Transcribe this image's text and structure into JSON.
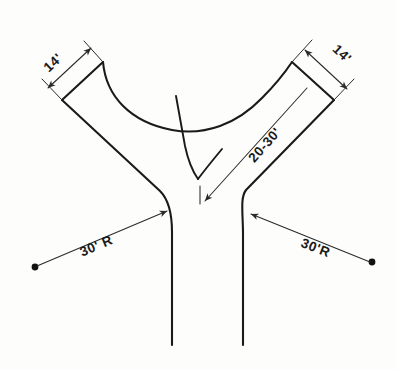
{
  "drawing": {
    "title": "Y-Intersection / Driveway Throat Detail",
    "background_color": "#fdfdfc",
    "line_color": "#1a1a1a",
    "annotation_color": "#2a2a2a"
  },
  "annotations": {
    "left_width": {
      "label": "14'",
      "value": 14,
      "unit": "ft",
      "kind": "linear-dimension",
      "position": "top-left"
    },
    "right_width": {
      "label": "14'",
      "value": 14,
      "unit": "ft",
      "kind": "linear-dimension",
      "position": "top-right"
    },
    "throat_length": {
      "label": "20-30'",
      "value_min": 20,
      "value_max": 30,
      "unit": "ft",
      "kind": "leader-dimension",
      "position": "center-right"
    },
    "left_radius": {
      "label": "30' R",
      "value": 30,
      "unit": "ft",
      "kind": "radius-dimension",
      "position": "bottom-left"
    },
    "right_radius": {
      "label": "30'R",
      "value": 30,
      "unit": "ft",
      "kind": "radius-dimension",
      "position": "bottom-right"
    }
  },
  "geometry": {
    "left_arm_end_outer": [
      62,
      100
    ],
    "left_arm_end_inner": [
      103,
      62
    ],
    "right_arm_end_inner": [
      292,
      62
    ],
    "right_arm_end_outer": [
      334,
      100
    ],
    "junction_apex": [
      198,
      179
    ],
    "left_leg_x": 172,
    "right_leg_x": 243,
    "leg_bottom_y": 345,
    "left_radius_center": [
      35,
      267
    ],
    "right_radius_center": [
      372,
      262
    ]
  }
}
